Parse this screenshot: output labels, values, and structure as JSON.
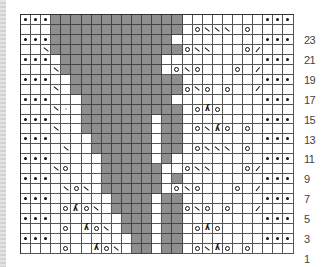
{
  "chart": {
    "columns": 27,
    "rows": 24,
    "colors": {
      "no_stitch": "#8f8f8f",
      "grid": "#555555",
      "background": "#ffffff"
    },
    "legend_symbols": {
      ".": "purl (dot)",
      "g": "no stitch (gray)",
      "o": "yarn over",
      "\\": "ssk (left-leaning decrease)",
      "/": "k2tog (right-leaning decrease)",
      "λ": "sk2p (double decrease)",
      "m": "faint mark",
      "_": "knit (blank)"
    },
    "row_labels": [
      "23",
      "21",
      "19",
      "17",
      "15",
      "13",
      "11",
      "9",
      "7",
      "5",
      "3",
      "1"
    ],
    "grid_top_to_bottom": [
      {
        "row": 24,
        "cells": [
          ".",
          ".",
          ".",
          "g",
          "g",
          "g",
          "g",
          "g",
          "g",
          "g",
          "g",
          "g",
          "g",
          "g",
          "g",
          "g",
          "_",
          "_",
          "_",
          "_",
          "_",
          "_",
          "_",
          "_",
          ".",
          ".",
          "."
        ]
      },
      {
        "row": 23,
        "cells": [
          "_",
          "_",
          "_",
          "g",
          "g",
          "g",
          "g",
          "g",
          "g",
          "g",
          "g",
          "g",
          "g",
          "g",
          "g",
          "g",
          "_",
          "o",
          "\\",
          "\\",
          "\\",
          "_",
          "o",
          "_",
          "_",
          "_",
          "_"
        ]
      },
      {
        "row": 22,
        "cells": [
          ".",
          ".",
          ".",
          "g",
          "g",
          "g",
          "g",
          "g",
          "g",
          "g",
          "g",
          "g",
          "g",
          "g",
          "g",
          "_",
          "_",
          "_",
          "_",
          "_",
          "_",
          "_",
          "_",
          "_",
          ".",
          ".",
          "."
        ]
      },
      {
        "row": 21,
        "cells": [
          "_",
          "_",
          "\\",
          "g",
          "g",
          "g",
          "g",
          "g",
          "g",
          "g",
          "g",
          "g",
          "g",
          "g",
          "g",
          "g",
          "o",
          "\\",
          "\\",
          "_",
          "_",
          "_",
          "o",
          "/",
          "_",
          "_",
          "_"
        ]
      },
      {
        "row": 20,
        "cells": [
          ".",
          ".",
          ".",
          "_",
          "g",
          "g",
          "g",
          "g",
          "g",
          "g",
          "g",
          "g",
          "g",
          "g",
          "_",
          "_",
          "_",
          "_",
          "_",
          "_",
          "_",
          "_",
          "_",
          "_",
          ".",
          ".",
          "."
        ]
      },
      {
        "row": 19,
        "cells": [
          "_",
          "_",
          "_",
          "\\",
          "g",
          "g",
          "g",
          "g",
          "g",
          "g",
          "g",
          "g",
          "g",
          "g",
          "_",
          "o",
          "\\",
          "o",
          "_",
          "_",
          "_",
          "o",
          "_",
          "/",
          "_",
          "_",
          "_"
        ]
      },
      {
        "row": 18,
        "cells": [
          ".",
          ".",
          ".",
          "_",
          "_",
          "g",
          "g",
          "g",
          "g",
          "g",
          "g",
          "g",
          "g",
          "g",
          "g",
          "g",
          "_",
          "_",
          "_",
          "_",
          "_",
          "_",
          "_",
          "_",
          ".",
          ".",
          "."
        ]
      },
      {
        "row": 17,
        "cells": [
          "_",
          "_",
          "_",
          "\\",
          "_",
          "g",
          "g",
          "g",
          "g",
          "g",
          "g",
          "g",
          "g",
          "g",
          "g",
          "g",
          "o",
          "\\",
          "o",
          "_",
          "o",
          "_",
          "_",
          "/",
          "_",
          "_",
          "_"
        ]
      },
      {
        "row": 16,
        "cells": [
          ".",
          ".",
          ".",
          "_",
          "_",
          "_",
          "g",
          "g",
          "g",
          "g",
          "g",
          "g",
          "g",
          "g",
          "g",
          "_",
          "_",
          "_",
          "_",
          "_",
          "_",
          "_",
          "_",
          "_",
          ".",
          ".",
          "."
        ]
      },
      {
        "row": 15,
        "cells": [
          "_",
          "_",
          "_",
          "\\",
          "m",
          "_",
          "g",
          "g",
          "g",
          "g",
          "g",
          "g",
          "g",
          "g",
          "g",
          "g",
          "_",
          "o",
          "λ",
          "o",
          "_",
          "_",
          "_",
          "_",
          "_",
          "_",
          "_"
        ]
      },
      {
        "row": 14,
        "cells": [
          ".",
          ".",
          ".",
          "_",
          "_",
          "_",
          "g",
          "g",
          "g",
          "g",
          "g",
          "g",
          "g",
          "_",
          "g",
          "g",
          "_",
          "_",
          "_",
          "_",
          "_",
          "_",
          "_",
          "_",
          ".",
          ".",
          "."
        ]
      },
      {
        "row": 13,
        "cells": [
          "_",
          "_",
          "_",
          "\\",
          "_",
          "_",
          "g",
          "g",
          "g",
          "g",
          "g",
          "g",
          "g",
          "_",
          "g",
          "g",
          "_",
          "o",
          "\\",
          "λ",
          "o",
          "_",
          "o",
          "_",
          "_",
          "_",
          "_"
        ]
      },
      {
        "row": 12,
        "cells": [
          ".",
          ".",
          ".",
          "_",
          "_",
          "_",
          "_",
          "g",
          "g",
          "g",
          "g",
          "g",
          "g",
          "_",
          "g",
          "g",
          "_",
          "_",
          "_",
          "_",
          "_",
          "_",
          "_",
          "_",
          ".",
          ".",
          "."
        ]
      },
      {
        "row": 11,
        "cells": [
          "_",
          "_",
          "_",
          "_",
          "\\",
          "_",
          "_",
          "g",
          "g",
          "g",
          "g",
          "g",
          "g",
          "_",
          "g",
          "g",
          "_",
          "o",
          "\\",
          "\\",
          "\\",
          "_",
          "o",
          "_",
          "_",
          "_",
          "_"
        ]
      },
      {
        "row": 10,
        "cells": [
          ".",
          ".",
          ".",
          "_",
          "_",
          "_",
          "_",
          "_",
          "g",
          "g",
          "g",
          "g",
          "g",
          "_",
          "g",
          "_",
          "_",
          "_",
          "_",
          "_",
          "_",
          "_",
          "_",
          "_",
          ".",
          ".",
          "."
        ]
      },
      {
        "row": 9,
        "cells": [
          "_",
          "_",
          "_",
          "\\",
          "o",
          "_",
          "_",
          "_",
          "g",
          "g",
          "g",
          "g",
          "g",
          "g",
          "_",
          "_",
          "o",
          "\\",
          "\\",
          "_",
          "_",
          "_",
          "o",
          "/",
          "_",
          "_",
          "_"
        ]
      },
      {
        "row": 8,
        "cells": [
          ".",
          ".",
          ".",
          "_",
          "_",
          "_",
          "_",
          "_",
          "g",
          "g",
          "g",
          "g",
          "g",
          "g",
          "_",
          "g",
          "_",
          "_",
          "_",
          "_",
          "_",
          "_",
          "_",
          "_",
          ".",
          ".",
          "."
        ]
      },
      {
        "row": 7,
        "cells": [
          "_",
          "_",
          "_",
          "_",
          "\\",
          "o",
          "\\",
          "_",
          "g",
          "g",
          "g",
          "g",
          "g",
          "g",
          "_",
          "o",
          "\\",
          "o",
          "_",
          "_",
          "_",
          "o",
          "_",
          "/",
          "_",
          "_",
          "_"
        ]
      },
      {
        "row": 6,
        "cells": [
          ".",
          ".",
          ".",
          "_",
          "_",
          "_",
          "_",
          "_",
          "_",
          "g",
          "g",
          "g",
          "g",
          "_",
          "g",
          "g",
          "_",
          "_",
          "_",
          "_",
          "_",
          "_",
          "_",
          "_",
          ".",
          ".",
          "."
        ]
      },
      {
        "row": 5,
        "cells": [
          "_",
          "_",
          "_",
          "_",
          "o",
          "λ",
          "o",
          "\\",
          "_",
          "g",
          "g",
          "g",
          "g",
          "_",
          "g",
          "g",
          "o",
          "\\",
          "o",
          "_",
          "o",
          "_",
          "_",
          "/",
          "_",
          "_",
          "_"
        ]
      },
      {
        "row": 4,
        "cells": [
          ".",
          ".",
          ".",
          "_",
          "_",
          "_",
          "_",
          "_",
          "_",
          "_",
          "g",
          "g",
          "g",
          "_",
          "g",
          "g",
          "_",
          "_",
          "_",
          "_",
          "_",
          "_",
          "_",
          "_",
          ".",
          ".",
          "."
        ]
      },
      {
        "row": 3,
        "cells": [
          "_",
          "_",
          "_",
          "_",
          "o",
          "_",
          "λ",
          "o",
          "\\",
          "_",
          "g",
          "g",
          "g",
          "_",
          "g",
          "g",
          "_",
          "o",
          "λ",
          "o",
          "_",
          "_",
          "_",
          "_",
          "_",
          "_",
          "_"
        ]
      },
      {
        "row": 2,
        "cells": [
          ".",
          ".",
          ".",
          "_",
          "_",
          "_",
          "_",
          "_",
          "_",
          "_",
          "_",
          "g",
          "g",
          "_",
          "g",
          "g",
          "_",
          "_",
          "_",
          "_",
          "_",
          "_",
          "_",
          "_",
          ".",
          ".",
          "."
        ]
      },
      {
        "row": 1,
        "cells": [
          "_",
          "_",
          "_",
          "_",
          "o",
          "_",
          "_",
          "λ",
          "o",
          "\\",
          "_",
          "g",
          "g",
          "_",
          "g",
          "g",
          "_",
          "o",
          "\\",
          "λ",
          "o",
          "_",
          "o",
          "_",
          "_",
          "_",
          "_"
        ]
      }
    ]
  }
}
